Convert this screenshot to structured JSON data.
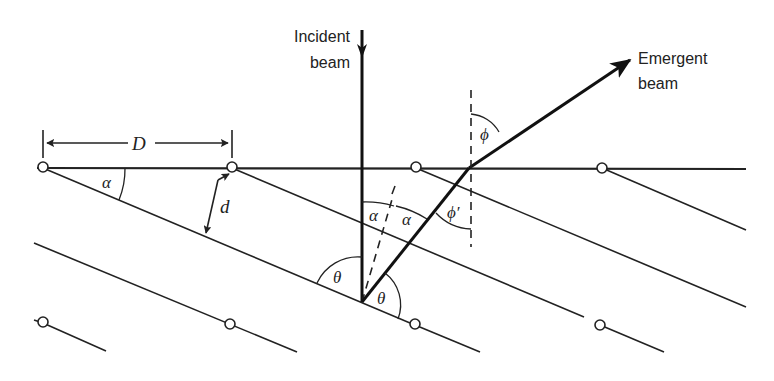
{
  "diagram": {
    "labels": {
      "incident_line1": "Incident",
      "incident_line2": "beam",
      "emergent_line1": "Emergent",
      "emergent_line2": "beam",
      "spacing_D": "D",
      "spacing_d": "d",
      "alpha_surface": "α",
      "alpha_left": "α",
      "alpha_right": "α",
      "theta_left": "θ",
      "theta_right": "θ",
      "phi": "ϕ",
      "phi_prime": "ϕ′"
    },
    "elements": {
      "surface": "horizontal crystal surface",
      "lattice_planes": "parallel lattice planes inclined at angle alpha",
      "atoms_top_row": 4,
      "atoms_bottom_row": 4
    }
  }
}
